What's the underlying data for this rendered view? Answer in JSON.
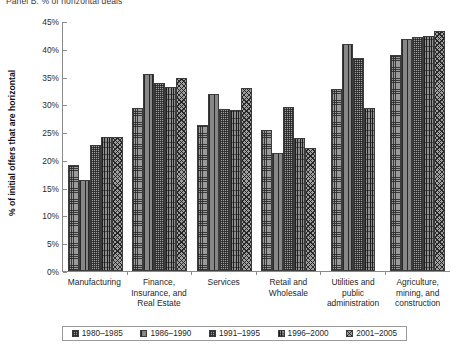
{
  "panel": {
    "title": "Panel B: % of horizontal deals"
  },
  "chart_data": {
    "type": "bar",
    "title": "Panel B: % of horizontal deals",
    "xlabel": "",
    "ylabel": "% of initial offers that are horizontal",
    "ylim": [
      0,
      45
    ],
    "ytick_labels": [
      "45%",
      "40%",
      "35%",
      "30%",
      "25%",
      "20%",
      "15%",
      "10%",
      "5%",
      "0%"
    ],
    "ytick_values": [
      45,
      40,
      35,
      30,
      25,
      20,
      15,
      10,
      5,
      0
    ],
    "grid": false,
    "legend_position": "bottom",
    "categories": [
      "Manufacturing",
      "Finance, Insurance, and Real Estate",
      "Services",
      "Retail and Wholesale",
      "Utilities and public administration",
      "Agriculture, mining, and construction"
    ],
    "category_lines": [
      [
        "Manufacturing"
      ],
      [
        "Finance,",
        "Insurance, and",
        "Real Estate"
      ],
      [
        "Services"
      ],
      [
        "Retail and",
        "Wholesale"
      ],
      [
        "Utilities and",
        "public",
        "administration"
      ],
      [
        "Agriculture,",
        "mining, and",
        "construction"
      ]
    ],
    "series": [
      {
        "name": "1980–1985",
        "values": [
          19.0,
          29.3,
          26.2,
          25.3,
          32.7,
          38.8
        ]
      },
      {
        "name": "1986–1990",
        "values": [
          16.3,
          35.4,
          31.8,
          21.2,
          40.9,
          41.8
        ]
      },
      {
        "name": "1991–1995",
        "values": [
          22.6,
          33.9,
          29.2,
          29.6,
          38.3,
          42.1
        ]
      },
      {
        "name": "1996–2000",
        "values": [
          24.1,
          33.2,
          28.9,
          24.0,
          29.3,
          42.3
        ]
      },
      {
        "name": "2001–2005",
        "values": [
          24.2,
          34.7,
          33.0,
          22.2,
          0.0,
          43.2
        ]
      }
    ]
  },
  "legend": {
    "items": [
      {
        "label": "1980–1985"
      },
      {
        "label": "1986–1990"
      },
      {
        "label": "1991–1995"
      },
      {
        "label": "1996–2000"
      },
      {
        "label": "2001–2005"
      }
    ]
  },
  "colors": {
    "axis": "#8a8a8a",
    "bar_outline": "#3c3c3c",
    "bar_fill": "#969696",
    "text": "#1f1f1f"
  }
}
